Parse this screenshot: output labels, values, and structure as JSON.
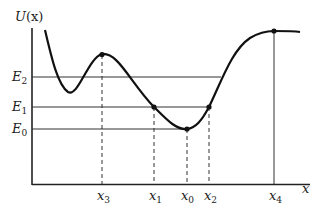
{
  "diagram": {
    "y_axis_label": {
      "main": "U",
      "arg": "(x)"
    },
    "x_axis_label": "x",
    "energy_levels": [
      {
        "name": "E",
        "sub": "2"
      },
      {
        "name": "E",
        "sub": "1"
      },
      {
        "name": "E",
        "sub": "0"
      }
    ],
    "x_marks": [
      {
        "name": "x",
        "sub": "3"
      },
      {
        "name": "x",
        "sub": "1"
      },
      {
        "name": "x",
        "sub": "0"
      },
      {
        "name": "x",
        "sub": "2"
      },
      {
        "name": "x",
        "sub": "4"
      }
    ],
    "colors": {
      "curve": "#111111",
      "axes": "#222222",
      "lines": "#333333"
    }
  }
}
